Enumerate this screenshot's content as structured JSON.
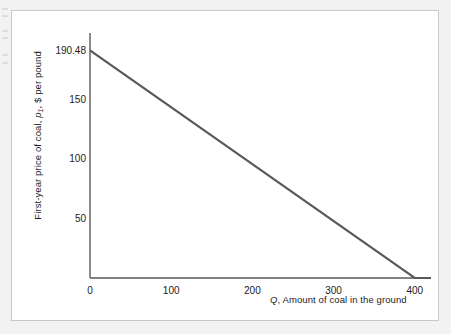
{
  "figure": {
    "panel_background": "#ffffff",
    "panel_border_color": "#c8c8c8",
    "page_background": "#f2f2f2"
  },
  "chart_data": {
    "type": "line",
    "title": "",
    "subtitle": "",
    "xlabel_prefix": "Q",
    "xlabel_rest": ", Amount of coal in the ground",
    "ylabel_prefix": "First-year price of coal, ",
    "ylabel_var": "p",
    "ylabel_var_sub": "1",
    "ylabel_rest": ", $ per pound",
    "xlim": [
      0,
      420
    ],
    "ylim": [
      0,
      205
    ],
    "xticks": [
      0,
      100,
      200,
      300,
      400
    ],
    "xtick_labels": [
      "0",
      "100",
      "200",
      "300",
      "400"
    ],
    "yticks": [
      50,
      100,
      150,
      190.48
    ],
    "ytick_labels": [
      "50",
      "100",
      "150",
      "190.48"
    ],
    "grid": false,
    "legend": false,
    "axis_style": "left-and-bottom-spines",
    "line_color": "#58595b",
    "line_width": 2.2,
    "series": [
      {
        "name": "first-year price of coal",
        "x": [
          0,
          400,
          420
        ],
        "values": [
          190.48,
          0,
          0
        ],
        "intercept": 190.48,
        "x_intercept": 400,
        "slope": -0.4762
      }
    ],
    "annotations": []
  },
  "scan_artifacts": {
    "count": 6,
    "description": "faint page bleed-through marks at left edge"
  }
}
